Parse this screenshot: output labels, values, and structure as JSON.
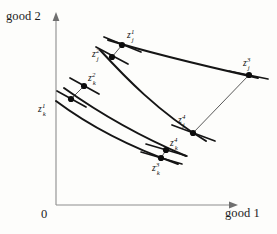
{
  "figure": {
    "background_color": "#fdfdfb",
    "ink_color": "#151515",
    "axis_color": "#8d8d8d"
  },
  "axes": {
    "x_label": "good 1",
    "y_label": "good 2",
    "origin_label": "0",
    "x_axis": {
      "x1": 56,
      "y1": 205,
      "x2": 236,
      "y2": 205
    },
    "y_axis": {
      "x1": 56,
      "y1": 205,
      "x2": 56,
      "y2": 16
    }
  },
  "points": [
    {
      "id": "z1j",
      "base": "z",
      "superscript": "1",
      "subscript": "j",
      "x": 122,
      "y": 45,
      "label_x": 127,
      "label_y": 29
    },
    {
      "id": "z2j",
      "base": "z",
      "superscript": "2",
      "subscript": "j",
      "x": 112,
      "y": 57,
      "label_x": 92,
      "label_y": 48
    },
    {
      "id": "z3j",
      "base": "z",
      "superscript": "3",
      "subscript": "j",
      "x": 249,
      "y": 75,
      "label_x": 243,
      "label_y": 57
    },
    {
      "id": "z4j",
      "base": "z",
      "superscript": "4",
      "subscript": "j",
      "x": 193,
      "y": 133,
      "label_x": 178,
      "label_y": 114
    },
    {
      "id": "z1k",
      "base": "z",
      "superscript": "1",
      "subscript": "k",
      "x": 71,
      "y": 99,
      "label_x": 38,
      "label_y": 103
    },
    {
      "id": "z2k",
      "base": "z",
      "superscript": "2",
      "subscript": "k",
      "x": 84,
      "y": 86,
      "label_x": 88,
      "label_y": 72
    },
    {
      "id": "z3k",
      "base": "z",
      "superscript": "3",
      "subscript": "k",
      "x": 161,
      "y": 158,
      "label_x": 152,
      "label_y": 162
    },
    {
      "id": "z4k",
      "base": "z",
      "superscript": "4",
      "subscript": "k",
      "x": 166,
      "y": 150,
      "label_x": 170,
      "label_y": 137
    }
  ],
  "curves": [
    {
      "id": "curve-j-upper",
      "path": "M 108 40 C 140 50, 196 64, 258 78"
    },
    {
      "id": "curve-j-lower",
      "path": "M 100 50 C 124 76, 158 112, 206 141"
    },
    {
      "id": "curve-k-upper",
      "path": "M 64 88 C 92 108, 134 134, 186 156"
    },
    {
      "id": "curve-k-lower",
      "path": "M 56 101 C 84 122, 124 145, 178 164"
    }
  ],
  "tangents": [
    {
      "id": "tangent-z1j",
      "path": "M 104 37 L 141 52"
    },
    {
      "id": "tangent-z2j",
      "path": "M 96 47 L 128 64"
    },
    {
      "id": "tangent-z3j",
      "path": "M 229 71 L 268 79"
    },
    {
      "id": "tangent-z4j",
      "path": "M 172 125 L 215 141"
    },
    {
      "id": "tangent-z1k",
      "path": "M 57 91 L 86 107"
    },
    {
      "id": "tangent-z2k",
      "path": "M 70 78 L 99 94"
    },
    {
      "id": "tangent-z3k",
      "path": "M 141 152 L 182 164"
    },
    {
      "id": "tangent-z4k",
      "path": "M 146 144 L 187 156"
    }
  ],
  "connectors": [
    {
      "id": "connector-z3j-z4j",
      "from": "z3j",
      "to": "z4j",
      "path": "M 249 75 L 193 133"
    },
    {
      "id": "connector-z1j-z2j",
      "from": "z1j",
      "to": "z2j",
      "path": "M 122 45 L 112 57"
    },
    {
      "id": "connector-z1k-z2k",
      "from": "z1k",
      "to": "z2k",
      "path": "M 71 99 L 84 86"
    },
    {
      "id": "connector-z3k-z4k",
      "from": "z3k",
      "to": "z4k",
      "path": "M 161 158 L 166 150"
    }
  ]
}
